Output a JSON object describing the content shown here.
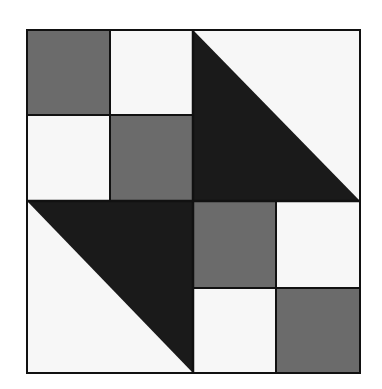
{
  "figure": {
    "type": "quilt-block-pattern",
    "grid": "4x4 units, two 2x2 four-patch blocks and two half-square triangle blocks",
    "colors": {
      "background": "#ffffff",
      "light": "#f7f7f7",
      "medium": "#6b6b6b",
      "dark": "#1a1a1a",
      "outline": "#111111"
    },
    "bounds": {
      "left": 27,
      "top": 30,
      "right": 360,
      "bottom": 373
    },
    "divisions": {
      "x": [
        27,
        110,
        193,
        276,
        360
      ],
      "y": [
        30,
        115,
        201,
        288,
        373
      ]
    },
    "blocks": [
      {
        "position": "top-left",
        "kind": "four-patch",
        "cells": [
          "medium",
          "light",
          "light",
          "medium"
        ]
      },
      {
        "position": "top-right",
        "kind": "half-square-triangle",
        "dark_half": "bottom-left",
        "light_half": "top-right"
      },
      {
        "position": "bottom-left",
        "kind": "half-square-triangle",
        "dark_half": "top-right",
        "light_half": "bottom-left"
      },
      {
        "position": "bottom-right",
        "kind": "four-patch",
        "cells": [
          "medium",
          "light",
          "light",
          "medium"
        ]
      }
    ]
  }
}
